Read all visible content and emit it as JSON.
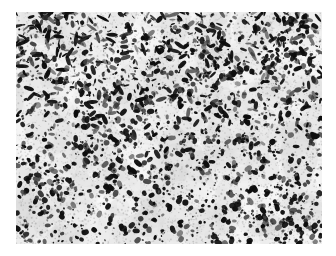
{
  "page": {
    "width": 336,
    "height": 256,
    "background_color": "#ffffff",
    "content_type": "grayscale-micrograph"
  },
  "figure": {
    "name": "micrograph-panel",
    "x": 16,
    "y": 12,
    "width": 306,
    "height": 232,
    "background_color": "#ededed",
    "border": "none",
    "label": ""
  },
  "image_data": {
    "type": "texture",
    "modality": "light-microscopy-autoradiograph",
    "background": {
      "base_color": "#f0f0f0",
      "mottle_color": "#d8d8d8",
      "mottle_light_color": "#fafafa",
      "mottle_blob_count": 520,
      "mottle_min_radius": 4,
      "mottle_max_radius": 22,
      "mottle_opacity_min": 0.1,
      "mottle_opacity_max": 0.42
    },
    "grains": {
      "color_dark": "#0d0d0d",
      "color_mid": "#2b2b2b",
      "color_light": "#565656",
      "count": 2300,
      "min_radius": 0.7,
      "max_radius": 3.1,
      "elongation_max": 2.6,
      "density_gradient": "upper-left and upper-right denser with elongated streaks; lower-left sparsest; lower-right rounder discrete dots"
    },
    "speckle": {
      "color": "#9a9a9a",
      "count": 5200,
      "min_radius": 0.35,
      "max_radius": 1.0,
      "opacity": 0.5
    },
    "noise_seed": 20240517
  },
  "annotations": {
    "scale_bar": "",
    "panel_letter": "",
    "title": "",
    "caption": ""
  }
}
